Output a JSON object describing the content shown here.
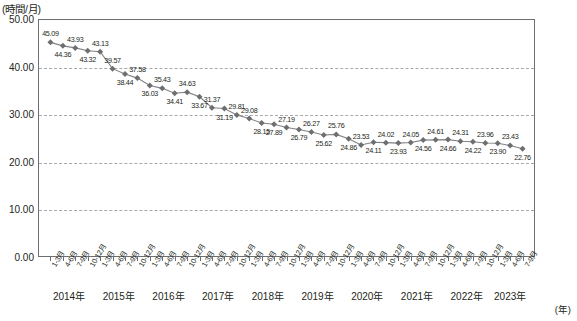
{
  "chart_data": {
    "type": "line",
    "title": "",
    "subtitle": "",
    "ylabel": "(時間/月)",
    "xlabel": "(年)",
    "ylim": [
      0,
      50
    ],
    "yticks": [
      "0.00",
      "10.00",
      "20.00",
      "30.00",
      "40.00",
      "50.00"
    ],
    "ytick_values": [
      0,
      10,
      20,
      30,
      40,
      50
    ],
    "grid": true,
    "legend": "none",
    "categories": [
      "1-3月",
      "4-6月",
      "7-9月",
      "10-12月",
      "1-3月",
      "4-6月",
      "7-9月",
      "10-12月",
      "1-3月",
      "4-6月",
      "7-9月",
      "10-12月",
      "1-3月",
      "4-6月",
      "7-9月",
      "10-12月",
      "1-3月",
      "4-6月",
      "7-9月",
      "10-12月",
      "1-3月",
      "4-6月",
      "7-9月",
      "10-12月",
      "1-3月",
      "4-6月",
      "7-9月",
      "10-12月",
      "1-3月",
      "4-6月",
      "7-9月",
      "10-12月",
      "1-3月",
      "4-6月",
      "7-9月",
      "10-12月",
      "1-3月",
      "4-6月",
      "7-9月"
    ],
    "values": [
      45.09,
      44.36,
      43.93,
      43.32,
      43.13,
      39.57,
      38.44,
      37.58,
      36.03,
      35.43,
      34.41,
      34.63,
      33.67,
      31.37,
      31.19,
      29.81,
      29.08,
      28.15,
      27.89,
      27.19,
      26.79,
      26.27,
      25.62,
      25.76,
      24.86,
      23.53,
      24.11,
      24.02,
      23.93,
      24.05,
      24.56,
      24.61,
      24.66,
      24.31,
      24.22,
      23.96,
      23.9,
      23.43,
      22.76
    ],
    "value_labels": [
      "45.09",
      "44.36",
      "43.93",
      "43.32",
      "43.13",
      "39.57",
      "38.44",
      "37.58",
      "36.03",
      "35.43",
      "34.41",
      "34.63",
      "33.67",
      "31.37",
      "31.19",
      "29.81",
      "29.08",
      "28.15",
      "27.89",
      "27.19",
      "26.79",
      "26.27",
      "25.62",
      "25.76",
      "24.86",
      "23.53",
      "24.11",
      "24.02",
      "23.93",
      "24.05",
      "24.56",
      "24.61",
      "24.66",
      "24.31",
      "24.22",
      "23.96",
      "23.90",
      "23.43",
      "22.76"
    ],
    "label_positions": [
      "above",
      "below",
      "above",
      "below",
      "above",
      "above",
      "below",
      "above",
      "below",
      "above",
      "below",
      "above",
      "below",
      "above",
      "below",
      "above",
      "above",
      "below",
      "below",
      "above",
      "below",
      "above",
      "below",
      "above",
      "below",
      "above",
      "below",
      "above",
      "below",
      "above",
      "below",
      "above",
      "below",
      "above",
      "below",
      "above",
      "below",
      "above",
      "below"
    ],
    "year_groups": [
      {
        "label": "2014年",
        "count": 4
      },
      {
        "label": "2015年",
        "count": 4
      },
      {
        "label": "2016年",
        "count": 4
      },
      {
        "label": "2017年",
        "count": 4
      },
      {
        "label": "2018年",
        "count": 4
      },
      {
        "label": "2019年",
        "count": 4
      },
      {
        "label": "2020年",
        "count": 4
      },
      {
        "label": "2021年",
        "count": 4
      },
      {
        "label": "2022年",
        "count": 4
      },
      {
        "label": "2023年",
        "count": 3
      }
    ],
    "colors": {
      "line": "#808285",
      "marker": "#6d6e70",
      "grid": "#a7a9ac",
      "axis": "#6d6e70",
      "text": "#231f20",
      "background": "#ffffff"
    }
  }
}
